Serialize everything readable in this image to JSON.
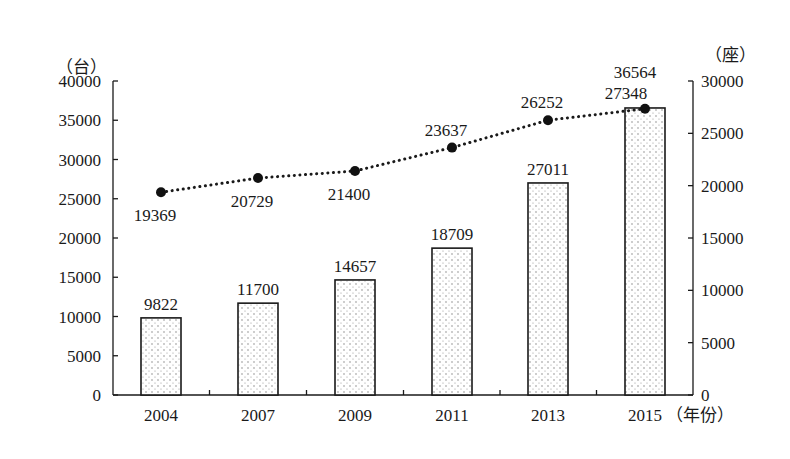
{
  "chart_data": {
    "type": "bar+line",
    "title": "",
    "categories": [
      "2004",
      "2007",
      "2009",
      "2011",
      "2013",
      "2015"
    ],
    "xlabel": "（年份）",
    "series": [
      {
        "name": "bar_series",
        "type": "bar",
        "axis": "left",
        "values": [
          9822,
          11700,
          14657,
          18709,
          27011,
          36564
        ]
      },
      {
        "name": "line_series",
        "type": "line",
        "style": "dotted",
        "axis": "right",
        "values": [
          19369,
          20729,
          21400,
          23637,
          26252,
          27348
        ]
      }
    ],
    "left_axis": {
      "unit_label": "（台）",
      "ylim": [
        0,
        40000
      ],
      "ticks": [
        0,
        5000,
        10000,
        15000,
        20000,
        25000,
        30000,
        35000,
        40000
      ]
    },
    "right_axis": {
      "unit_label": "（座）",
      "ylim": [
        0,
        30000
      ],
      "ticks": [
        0,
        5000,
        10000,
        15000,
        20000,
        25000,
        30000
      ]
    },
    "grid": false,
    "legend": null,
    "line_label_positions": [
      "below",
      "below",
      "below",
      "above",
      "above",
      "above"
    ]
  },
  "colors": {
    "ink": "#1a1a1a",
    "background": "#ffffff"
  }
}
